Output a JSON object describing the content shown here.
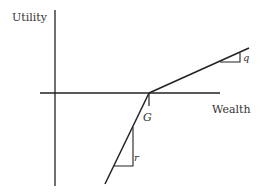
{
  "diagram": {
    "type": "piecewise-linear utility function",
    "axes": {
      "y_label": "Utility",
      "x_label": "Wealth"
    },
    "kink_point_label": "G",
    "slope_labels": {
      "upper_segment": "q",
      "lower_segment": "r"
    },
    "colors": {
      "line": "#222222",
      "text": "#333333",
      "background": "#ffffff"
    }
  }
}
